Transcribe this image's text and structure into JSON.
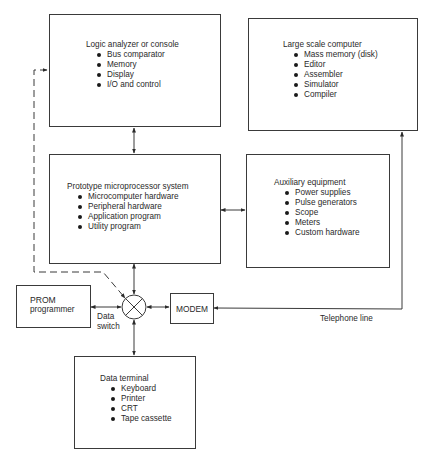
{
  "blocks": {
    "logic_analyzer": {
      "title": "Logic analyzer or console",
      "items": [
        "Bus comparator",
        "Memory",
        "Display",
        "I/O and control"
      ]
    },
    "large_computer": {
      "title": "Large scale computer",
      "items": [
        "Mass memory (disk)",
        "Editor",
        "Assembler",
        "Simulator",
        "Compiler"
      ]
    },
    "prototype": {
      "title": "Prototype microprocessor system",
      "items": [
        "Microcomputer hardware",
        "Peripheral hardware",
        "Application program",
        "Utility program"
      ]
    },
    "auxiliary": {
      "title": "Auxiliary equipment",
      "items": [
        "Power supplies",
        "Pulse generators",
        "Scope",
        "Meters",
        "Custom hardware"
      ]
    },
    "prom": {
      "line1": "PROM",
      "line2": "programmer"
    },
    "modem": {
      "title": "MODEM"
    },
    "data_terminal": {
      "title": "Data terminal",
      "items": [
        "Keyboard",
        "Printer",
        "CRT",
        "Tape cassette"
      ]
    }
  },
  "labels": {
    "data_switch_line1": "Data",
    "data_switch_line2": "switch",
    "telephone_line": "Telephone line"
  },
  "colors": {
    "line": "#3a3a3a",
    "text": "#2a2a2a",
    "background": "#ffffff"
  }
}
